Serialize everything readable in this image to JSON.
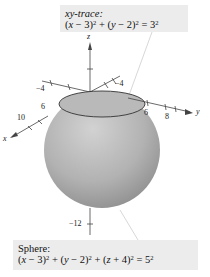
{
  "trace_callout": {
    "title": "xy-trace:",
    "equation": "(x − 3)² + (y − 2)² = 3²",
    "eq_parts": {
      "a": "(",
      "x": "x",
      "b": " − 3)",
      "s1": "2",
      "c": " + (",
      "y": "y",
      "d": " − 2)",
      "s2": "2",
      "e": " = 3",
      "s3": "2"
    }
  },
  "sphere_callout": {
    "title": "Sphere:",
    "equation": "(x − 3)² + (y − 2)² + (z + 4)² = 5²",
    "eq_parts": {
      "a": "(",
      "x": "x",
      "b": " − 3)",
      "s1": "2",
      "c": " + (",
      "y": "y",
      "d": " − 2)",
      "s2": "2",
      "f": " + (",
      "z": "z",
      "g": " + 4)",
      "s3": "2",
      "e": " = 5",
      "s4": "2"
    }
  },
  "axes": {
    "x_label": "x",
    "y_label": "y",
    "z_label": "z",
    "x_ticks": [
      "−4",
      "6",
      "10"
    ],
    "y_ticks": [
      "−4",
      "6",
      "8"
    ],
    "z_ticks": [
      "−12"
    ]
  },
  "sphere": {
    "center": [
      3,
      2,
      -4
    ],
    "radius": 5,
    "fill_light": "#c8c8c8",
    "fill_dark": "#8a8a8a"
  },
  "trace": {
    "center": [
      3,
      2
    ],
    "radius": 3
  }
}
